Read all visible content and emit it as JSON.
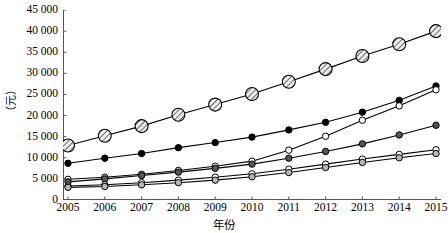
{
  "chart_data": {
    "type": "line",
    "title": "",
    "xlabel": "年份",
    "ylabel": "（元）",
    "grid": false,
    "legend_position": "none",
    "x": [
      2005,
      2006,
      2007,
      2008,
      2009,
      2010,
      2011,
      2012,
      2013,
      2014,
      2015
    ],
    "xtick_labels": [
      "2005",
      "2006",
      "2007",
      "2008",
      "2009",
      "2010",
      "2011",
      "2012",
      "2013",
      "2014",
      "2015"
    ],
    "ytick_labels": [
      "0",
      "5 000",
      "10 000",
      "15 000",
      "20 000",
      "25 000",
      "30 000",
      "35 000",
      "40 000",
      "45 000"
    ],
    "ytick_values": [
      0,
      5000,
      10000,
      15000,
      20000,
      25000,
      30000,
      35000,
      40000,
      45000
    ],
    "ylim": [
      0,
      45000
    ],
    "xlim": [
      2005,
      2015
    ],
    "series": [
      {
        "name": "series-1",
        "marker": "hatched-circle",
        "marker_size": 9,
        "fill": "#e8e8e8",
        "stroke": "#000000",
        "values": [
          12900,
          15200,
          17500,
          20200,
          22600,
          25100,
          28000,
          31000,
          34100,
          36900,
          40000
        ]
      },
      {
        "name": "series-2",
        "marker": "filled-circle",
        "marker_size": 5.2,
        "fill": "#000000",
        "stroke": "#000000",
        "values": [
          8700,
          9900,
          11000,
          12400,
          13600,
          14900,
          16600,
          18400,
          20800,
          23600,
          27000
        ]
      },
      {
        "name": "series-3",
        "marker": "open-circle",
        "marker_size": 5.2,
        "fill": "#ffffff",
        "stroke": "#000000",
        "values": [
          4900,
          5400,
          6100,
          7000,
          8000,
          9200,
          11800,
          15100,
          18900,
          22300,
          26100
        ]
      },
      {
        "name": "series-4",
        "marker": "filled-circle",
        "marker_size": 5.2,
        "fill": "#555555",
        "stroke": "#000000",
        "values": [
          4300,
          5000,
          5800,
          6600,
          7500,
          8500,
          9900,
          11500,
          13300,
          15400,
          17700
        ]
      },
      {
        "name": "series-5",
        "marker": "open-circle",
        "marker_size": 5.2,
        "fill": "#ffffff",
        "stroke": "#000000",
        "values": [
          3300,
          3600,
          4100,
          4700,
          5400,
          6200,
          7300,
          8500,
          9700,
          10800,
          11900
        ]
      },
      {
        "name": "series-6",
        "marker": "filled-circle",
        "marker_size": 5.2,
        "fill": "#b8b8b8",
        "stroke": "#000000",
        "values": [
          3000,
          3200,
          3600,
          4100,
          4700,
          5500,
          6500,
          7700,
          8900,
          10000,
          11000
        ]
      }
    ]
  }
}
